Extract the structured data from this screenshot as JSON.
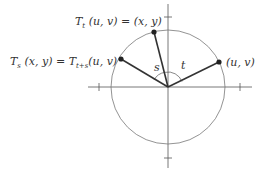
{
  "diagram": {
    "labels": {
      "point_uv": "(u, v)",
      "point_t_lhs": "T",
      "point_t_sub": "t",
      "point_t_rhs": " (u, v) = (x, y)",
      "point_s_lhs": "T",
      "point_s_sub": "s",
      "point_s_mid": " (x, y) = T",
      "point_s_sub2": "t+s",
      "point_s_rhs": "(u, v)",
      "angle_s": "s",
      "angle_t": "t"
    },
    "colors": {
      "axis": "#555555",
      "circle": "#777777",
      "segment": "#333333",
      "point": "#222222"
    }
  }
}
